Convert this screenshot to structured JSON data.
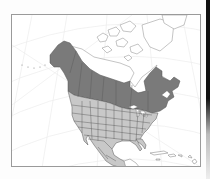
{
  "map": {
    "type": "range-map",
    "region": "North America",
    "legend": [],
    "colors": {
      "range_primary": "#7a7a7a",
      "range_secondary": "#c8c8c8",
      "land_outside": "#ffffff",
      "water": "#ffffff",
      "borders": "#555555",
      "graticule": "#ececec",
      "frame": "#9a9a9a"
    },
    "zones": [
      {
        "name": "northern-zone",
        "shade": "dark",
        "covers": "Alaska and southern/central Canada from Yukon to Labrador and Newfoundland"
      },
      {
        "name": "southern-zone",
        "shade": "light",
        "covers": "Contiguous United States, Mexico and Central America"
      }
    ]
  }
}
